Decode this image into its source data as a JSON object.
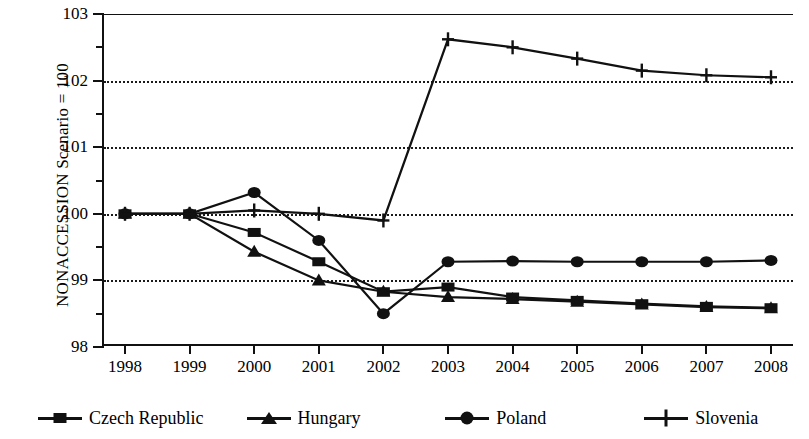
{
  "chart_data": {
    "type": "line",
    "title": "",
    "xlabel": "",
    "ylabel": "NONACCESSION Scenario = 100",
    "categories": [
      "1998",
      "1999",
      "2000",
      "2001",
      "2002",
      "2003",
      "2004",
      "2005",
      "2006",
      "2007",
      "2008"
    ],
    "x": [
      1998,
      1999,
      2000,
      2001,
      2002,
      2003,
      2004,
      2005,
      2006,
      2007,
      2008
    ],
    "xlim": [
      1998,
      2008
    ],
    "ylim": [
      98,
      103
    ],
    "ytick_labels": [
      "98",
      "99",
      "100",
      "101",
      "102",
      "103"
    ],
    "ytick_values": [
      98,
      99,
      100,
      101,
      102,
      103
    ],
    "yminor_values": [
      98.5,
      99.5,
      100.5,
      101.5,
      102.5
    ],
    "grid": "horizontal-dotted",
    "gridline_values": [
      99,
      100,
      101,
      102
    ],
    "legend_position": "bottom",
    "series": [
      {
        "name": "Czech Republic",
        "marker": "square",
        "color": "#111111",
        "values": [
          100.0,
          100.0,
          99.72,
          99.28,
          98.83,
          98.9,
          98.75,
          98.7,
          98.65,
          98.61,
          98.59
        ]
      },
      {
        "name": "Hungary",
        "marker": "triangle",
        "color": "#111111",
        "values": [
          100.0,
          100.0,
          99.43,
          99.0,
          98.83,
          98.75,
          98.72,
          98.68,
          98.64,
          98.6,
          98.58
        ]
      },
      {
        "name": "Poland",
        "marker": "circle",
        "color": "#111111",
        "values": [
          100.0,
          100.0,
          100.32,
          99.6,
          98.5,
          99.28,
          99.29,
          99.28,
          99.28,
          99.28,
          99.3
        ]
      },
      {
        "name": "Slovenia",
        "marker": "plus",
        "color": "#111111",
        "values": [
          100.0,
          100.0,
          100.05,
          100.0,
          99.9,
          102.62,
          102.5,
          102.33,
          102.15,
          102.08,
          102.05
        ]
      }
    ]
  },
  "legend": {
    "items": [
      {
        "label": "Czech Republic",
        "marker": "square"
      },
      {
        "label": "Hungary",
        "marker": "triangle"
      },
      {
        "label": "Poland",
        "marker": "circle"
      },
      {
        "label": "Slovenia",
        "marker": "plus"
      }
    ]
  },
  "axes": {
    "y_title": "NONACCESSION Scenario = 100"
  }
}
